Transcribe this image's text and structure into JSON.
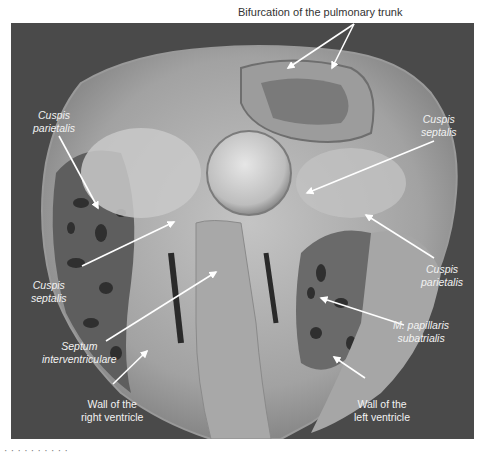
{
  "figure": {
    "type": "anatomical photograph (grayscale), heart specimen frontal section",
    "top_label": "Bifurcation of the pulmonary trunk",
    "labels": [
      {
        "id": "cuspis-parietalis-left",
        "line1": "Cuspis",
        "line2": "parietalis",
        "italic": true
      },
      {
        "id": "cuspis-septalis-right",
        "line1": "Cuspis",
        "line2": "septalis",
        "italic": true
      },
      {
        "id": "cuspis-septalis-left",
        "line1": "Cuspis",
        "line2": "septalis",
        "italic": true
      },
      {
        "id": "cuspis-parietalis-right",
        "line1": "Cuspis",
        "line2": "parietalis",
        "italic": true
      },
      {
        "id": "septum",
        "line1": "Septum",
        "line2": "interventriculare",
        "italic": true
      },
      {
        "id": "m-papillaris",
        "line1": "M. papillaris",
        "line2": "subatrialis",
        "italic": true
      },
      {
        "id": "wall-right",
        "line1": "Wall of the",
        "line2": "right ventricle",
        "italic": false
      },
      {
        "id": "wall-left",
        "line1": "Wall of the",
        "line2": "left ventricle",
        "italic": false
      }
    ],
    "caption_partial": "· · · · · · · · · ·",
    "colors": {
      "background": "#4a4a4a",
      "label": "#f2f2f2",
      "arrow": "#ffffff",
      "tissue_light": "#b8b8b8",
      "tissue_mid": "#8e8e8e",
      "tissue_dark": "#2a2a2a"
    }
  }
}
